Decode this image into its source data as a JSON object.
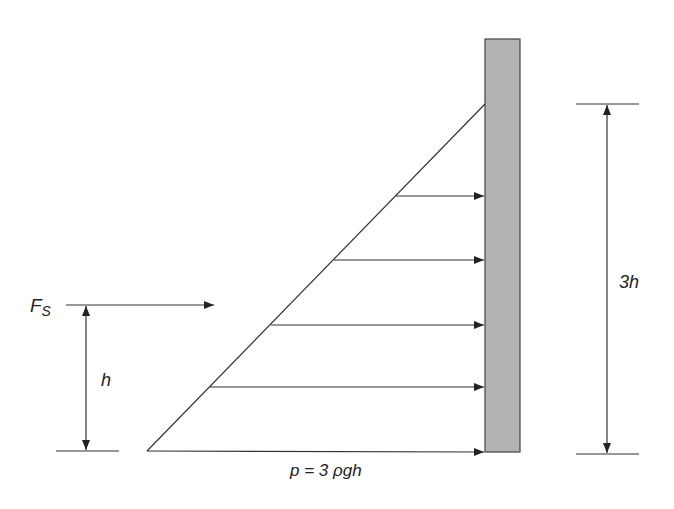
{
  "diagram": {
    "labels": {
      "force": "F",
      "force_sub": "S",
      "lever_arm": "h",
      "depth": "3h",
      "pressure": "p = 3 ρgh"
    },
    "colors": {
      "line": "#333333",
      "wall_fill": "#b4b4b4",
      "wall_stroke": "#444444",
      "background": "#ffffff"
    },
    "wall": {
      "x": 485,
      "y": 39,
      "width": 35,
      "height": 413
    },
    "triangle": {
      "apex": [
        485,
        104
      ],
      "base_left": [
        147,
        451
      ],
      "base_right": [
        485,
        451
      ]
    },
    "pressure_arrows": [
      {
        "x1": 396,
        "y": 196
      },
      {
        "x1": 334,
        "y": 260
      },
      {
        "x1": 271,
        "y": 325
      },
      {
        "x1": 210,
        "y": 387
      },
      {
        "x1": 147,
        "y": 451
      }
    ]
  }
}
